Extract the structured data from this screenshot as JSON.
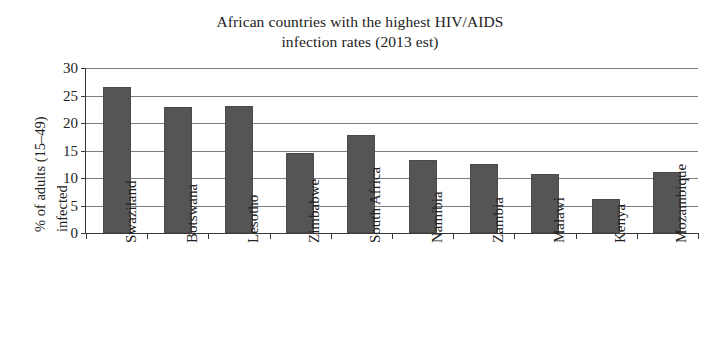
{
  "chart_data": {
    "type": "bar",
    "title": "African countries with the highest HIV/AIDS infection rates (2013 est)",
    "title_lines": [
      "African countries with the highest HIV/AIDS",
      "infection rates (2013 est)"
    ],
    "xlabel": "",
    "ylabel": "% of adults (15–49) infected",
    "ylabel_lines": [
      "% of adults (15–49)",
      "infected"
    ],
    "categories": [
      "Swaziland",
      "Botswana",
      "Lesotho",
      "Zimbabwe",
      "South Africa",
      "Namibia",
      "Zambia",
      "Malawi",
      "Kenya",
      "Mozambique"
    ],
    "values": [
      26.5,
      22.9,
      23.1,
      14.6,
      17.9,
      13.3,
      12.5,
      10.8,
      6.2,
      11.1
    ],
    "ylim": [
      0,
      30
    ],
    "yticks": [
      0,
      5,
      10,
      15,
      20,
      25,
      30
    ],
    "ytick_labels": [
      "0",
      "5",
      "10",
      "15",
      "20",
      "25",
      "30"
    ],
    "grid": true,
    "grid_axis": "y",
    "legend": "none",
    "bar_color": "#555555",
    "grid_color": "#7d7d7d",
    "axis_color": "#3a3a3a",
    "background_color": "#ffffff",
    "text_color": "#222222"
  }
}
